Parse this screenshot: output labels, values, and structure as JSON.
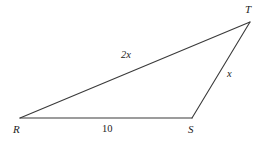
{
  "figure": {
    "type": "triangle-diagram",
    "background_color": "#ffffff",
    "stroke_color": "#3a3a3a",
    "text_color": "#1d1d1d",
    "vertices": [
      {
        "name": "R",
        "label": "R",
        "x": 20,
        "y": 118
      },
      {
        "name": "S",
        "label": "S",
        "x": 192,
        "y": 118
      },
      {
        "name": "T",
        "label": "T",
        "x": 250,
        "y": 22
      }
    ],
    "sides": [
      {
        "name": "RT",
        "label": "2x",
        "from": "R",
        "to": "T"
      },
      {
        "name": "ST",
        "label": "x",
        "from": "S",
        "to": "T"
      },
      {
        "name": "RS",
        "label": "10",
        "from": "R",
        "to": "S"
      }
    ]
  }
}
